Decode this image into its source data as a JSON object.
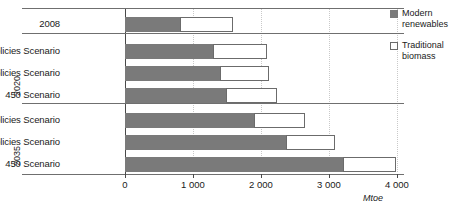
{
  "chart_data": {
    "type": "bar",
    "orientation": "horizontal",
    "stacked": true,
    "title": "",
    "xlabel": "Mtoe",
    "ylabel": "",
    "xlim": [
      0,
      4000
    ],
    "xticks": [
      0,
      1000,
      2000,
      3000,
      4000
    ],
    "xtick_labels": [
      "0",
      "1 000",
      "2 000",
      "3 000",
      "4 000"
    ],
    "grid": true,
    "grid_axis": "x",
    "legend_position": "right",
    "categories": [
      "2008",
      "Current Policies Scenario",
      "New Policies Scenario",
      "450 Scenario",
      "Current Policies Scenario",
      "New Policies Scenario",
      "450 Scenario"
    ],
    "groups": [
      {
        "label": "",
        "rows": [
          0
        ]
      },
      {
        "label": "2020",
        "rows": [
          1,
          2,
          3
        ]
      },
      {
        "label": "2035",
        "rows": [
          4,
          5,
          6
        ]
      }
    ],
    "series": [
      {
        "name": "Modern renewables",
        "color": "#7a7a7a",
        "values": [
          810,
          1300,
          1400,
          1490,
          1900,
          2370,
          3220
        ]
      },
      {
        "name": "Traditional biomass",
        "color": "#ffffff",
        "values": [
          790,
          790,
          730,
          760,
          760,
          730,
          780
        ]
      }
    ],
    "totals": [
      1600,
      2090,
      2130,
      2250,
      2660,
      3100,
      4000
    ]
  },
  "rows": [
    {
      "label": "2008",
      "modern": 810,
      "traditional": 790
    },
    {
      "label": "Current Policies Scenario",
      "modern": 1300,
      "traditional": 790
    },
    {
      "label": "New Policies Scenario",
      "modern": 1400,
      "traditional": 730
    },
    {
      "label": "450 Scenario",
      "modern": 1490,
      "traditional": 760
    },
    {
      "label": "Current Policies Scenario",
      "modern": 1900,
      "traditional": 760
    },
    {
      "label": "New Policies Scenario",
      "modern": 2370,
      "traditional": 730
    },
    {
      "label": "450 Scenario",
      "modern": 3220,
      "traditional": 780
    }
  ],
  "group_labels": [
    {
      "text": "2020"
    },
    {
      "text": "2035"
    }
  ],
  "axis": {
    "unit": "Mtoe",
    "ticks": [
      {
        "value": 0,
        "label": "0"
      },
      {
        "value": 1000,
        "label": "1 000"
      },
      {
        "value": 2000,
        "label": "2 000"
      },
      {
        "value": 3000,
        "label": "3 000"
      },
      {
        "value": 4000,
        "label": "4 000"
      }
    ]
  },
  "legend": {
    "items": [
      {
        "label": "Modern renewables",
        "swatch": "filled",
        "color": "#7a7a7a"
      },
      {
        "label": "Traditional biomass",
        "swatch": "hollow",
        "color": "#ffffff"
      }
    ]
  }
}
